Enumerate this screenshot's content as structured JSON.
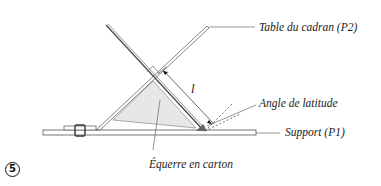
{
  "figure": {
    "number": "5",
    "labels": {
      "table": "Table du cadran (P2)",
      "angle": "Angle de latitude",
      "support": "Support (P1)",
      "square": "Équerre en carton",
      "length": "l"
    }
  },
  "colors": {
    "line": "#555555",
    "dark_line": "#444444",
    "triangle_fill": "#e6e6e6",
    "angle_fill": "#666666",
    "text": "#222222"
  }
}
